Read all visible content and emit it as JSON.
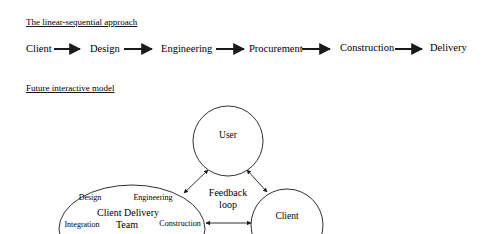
{
  "linear": {
    "title": "The linear-sequential approach",
    "steps": [
      "Client",
      "Design",
      "Engineering",
      "Procurement",
      "Construction",
      "Delivery"
    ]
  },
  "interactive": {
    "title": "Future interactive model",
    "user_label": "User",
    "client_label": "Client",
    "feedback_line1": "Feedback",
    "feedback_line2": "loop",
    "team": {
      "line1": "Client Delivery",
      "line2": "Team",
      "sub_design": "Design",
      "sub_engineering": "Engineering",
      "sub_integration": "Integration",
      "sub_construction": "Construction"
    }
  }
}
